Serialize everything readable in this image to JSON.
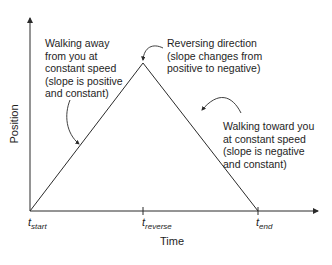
{
  "diagram": {
    "type": "position-time graph",
    "axes": {
      "x_label": "Time",
      "y_label": "Position"
    },
    "ticks": [
      {
        "base": "t",
        "sub": "start"
      },
      {
        "base": "t",
        "sub": "reverse"
      },
      {
        "base": "t",
        "sub": "end"
      }
    ],
    "annotations": {
      "rising": "Walking away\nfrom you at\nconstant speed\n(slope is positive\nand constant)",
      "peak": "Reversing direction\n(slope changes from\npositive to negative)",
      "falling": "Walking toward you\nat constant speed\n(slope is negative\nand constant)"
    },
    "colors": {
      "line": "#2a2a2a",
      "text": "#1e1e1e",
      "background": "#ffffff"
    }
  }
}
